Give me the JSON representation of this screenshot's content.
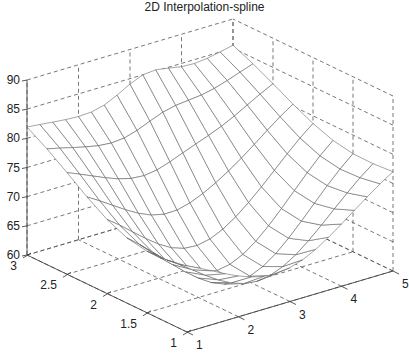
{
  "chart_data": {
    "type": "surface",
    "title": "2D Interpolation-spline",
    "xlabel": "",
    "ylabel": "",
    "zlabel": "",
    "xlim": [
      1,
      5
    ],
    "ylim": [
      1,
      3
    ],
    "zlim": [
      60,
      90
    ],
    "x_ticks": [
      "1",
      "2",
      "3",
      "4",
      "5"
    ],
    "y_ticks": [
      "1",
      "1.5",
      "2",
      "2.5",
      "3"
    ],
    "z_ticks": [
      "60",
      "65",
      "70",
      "75",
      "80",
      "85",
      "90"
    ],
    "grid": true,
    "grid_style": "dashed",
    "mesh_x": [
      1,
      1.25,
      1.5,
      1.75,
      2,
      2.25,
      2.5,
      2.75,
      3,
      3.25,
      3.5,
      3.75,
      4,
      4.25,
      4.5,
      4.75,
      5
    ],
    "mesh_y": [
      1,
      1.25,
      1.5,
      1.75,
      2,
      2.25,
      2.5,
      2.75,
      3
    ],
    "corner_values": {
      "x1_y1": 76,
      "x1_y3": 83.5,
      "x5_y1": 80.5,
      "x5_y3": 86.5
    },
    "minimum": {
      "x": 2.75,
      "y": 1.6,
      "z": 60.5
    }
  },
  "colors": {
    "mesh": "#555555",
    "axes": "#444444",
    "grid": "#555555",
    "background": "#ffffff"
  }
}
